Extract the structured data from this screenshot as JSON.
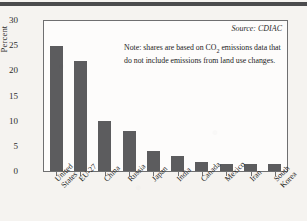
{
  "chart_data": {
    "type": "bar",
    "title": "",
    "xlabel": "",
    "ylabel": "Percent",
    "ylim": [
      0,
      30
    ],
    "yticks": [
      0,
      5,
      10,
      15,
      20,
      25,
      30
    ],
    "grid": false,
    "legend": null,
    "categories": [
      "United States",
      "EU-27",
      "China",
      "Russia",
      "Japan",
      "India",
      "Canada",
      "Mexico",
      "Iran",
      "South Korea"
    ],
    "category_lines": [
      [
        "United",
        "States"
      ],
      [
        "EU-27"
      ],
      [
        "China"
      ],
      [
        "Russia"
      ],
      [
        "Japan"
      ],
      [
        "India"
      ],
      [
        "Canada"
      ],
      [
        "Mexico"
      ],
      [
        "Iran"
      ],
      [
        "South",
        "Korea"
      ]
    ],
    "values": [
      25.0,
      22.0,
      10.0,
      8.0,
      4.0,
      3.0,
      1.8,
      1.5,
      1.5,
      1.5
    ],
    "bar_color": "#5c5c5e",
    "annotations": {
      "source": "Source: CDIAC",
      "note_line1_prefix": "Note: shares are based on CO",
      "note_line1_sub": "2",
      "note_line1_suffix": " emissions data that",
      "note_line2": "do not include emissions from land use changes."
    }
  }
}
